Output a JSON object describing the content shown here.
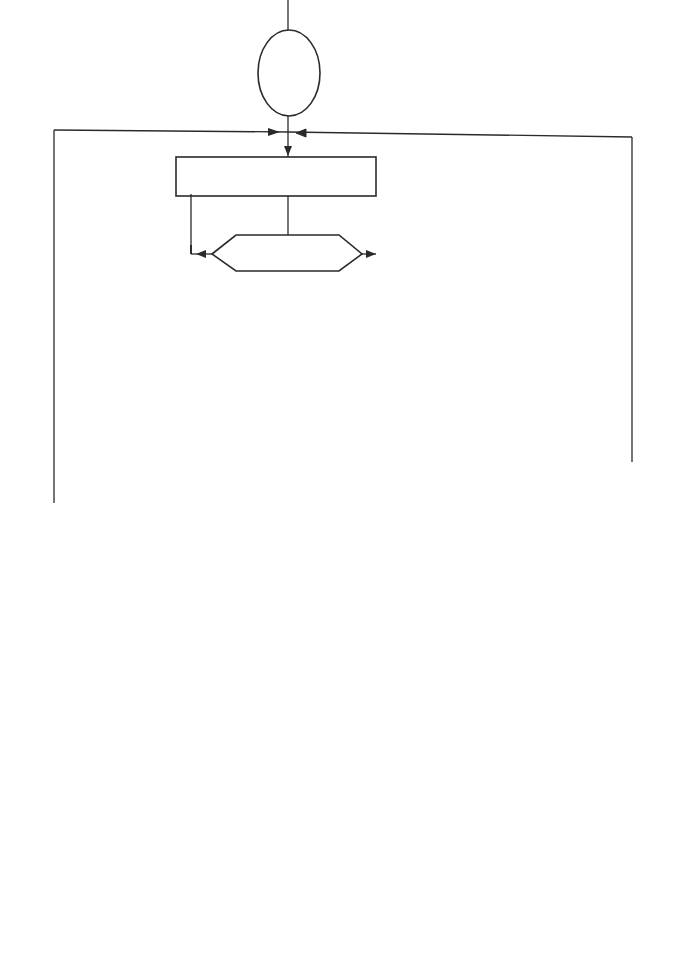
{
  "diagram": {
    "type": "flowchart",
    "nodes": {
      "enter": "enter",
      "select_next_member": "select next member",
      "test_type_1": "test type",
      "predict_beam": {
        "prefix": "predict ",
        "var": "Mmax",
        "mid": " at ",
        "lambda": "λw"
      },
      "predict_column": {
        "prefix": "predict ",
        "var": "Mmax",
        "mid": " at ",
        "lambda1": "λ1",
        "or": " or ",
        "lambda2": "λ2"
      },
      "is_mp_satisfactory": {
        "prefix": "is ",
        "var": "M'p",
        "suffix": " satisfactory"
      },
      "select_next_section_1": "select next section",
      "test_type_2": "test type",
      "last_beam": {
        "q": "?",
        "line1": "last",
        "line2": "beam"
      },
      "select_next_section_2": "select next section",
      "stable": {
        "q": "?",
        "line1": "stable"
      },
      "last_member": {
        "q": "?",
        "line1": "last",
        "line2": "member"
      },
      "select_next_column": {
        "line1": "select next",
        "line2": "column"
      },
      "inverse_taper_right": "inverse taper ?",
      "adopt_section_above": {
        "line1": "adopt section",
        "line2": "of column above"
      },
      "grouping_required": {
        "q": "?",
        "line1": "grouping",
        "line2": "required"
      },
      "inverse_taper_left": "inverse taper ?",
      "last_column": {
        "q": "?",
        "line1": "last",
        "line2": "column"
      },
      "last_group": {
        "q": "?",
        "line1": "last",
        "line2": "group"
      },
      "adopt_largest": {
        "line1": "adopt largest",
        "line2": "section in group"
      },
      "select_next_group": "select next group of columns",
      "exit": "exit"
    },
    "edge_labels": {
      "beam_1": "beam",
      "column_1": "column",
      "no_mp": "no",
      "yes_mp": "yes",
      "beam_2": "beam",
      "column_2": "column",
      "no_last_beam": "no",
      "yes_last_beam": "yes",
      "no_stable": "no",
      "yes_stable": "yes",
      "no_last_member": "no",
      "yes_last_member": "yes",
      "no_inv_right": "no",
      "yes_inv_right": "yes",
      "no_grouping": "no",
      "yes_grouping": "yes",
      "no_inv_left": "no",
      "yes_inv_left": "yes",
      "no_last_column": "no",
      "yes_last_column": "yes",
      "no_last_group": "no",
      "yes_last_group": "yes"
    }
  }
}
